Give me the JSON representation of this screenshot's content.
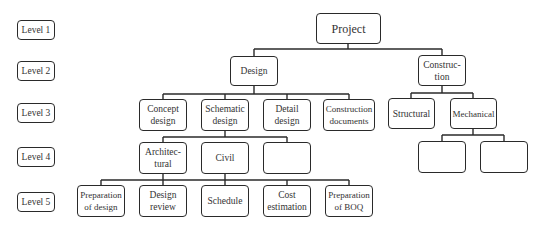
{
  "levels": [
    "Level 1",
    "Level 2",
    "Level 3",
    "Level 4",
    "Level 5"
  ],
  "nodes": {
    "project": "Project",
    "design": "Design",
    "construction": "Construc-\ntion",
    "concept_design": "Concept\ndesign",
    "schematic_design": "Schematic\ndesign",
    "detail_design": "Detail\ndesign",
    "construction_documents": "Construction\ndocuments",
    "structural": "Structural",
    "mechanical": "Mechanical",
    "architectural": "Architec-\ntural",
    "civil": "Civil",
    "empty_design_l4": "",
    "empty_mech_1": "",
    "empty_mech_2": "",
    "preparation_of_design": "Preparation\nof design",
    "design_review": "Design\nreview",
    "schedule": "Schedule",
    "cost_estimation": "Cost\nestimation",
    "preparation_of_boq": "Preparation\nof BOQ"
  },
  "colors": {
    "stroke": "#2a2a2a",
    "background": "#ffffff",
    "text": "#333333"
  }
}
